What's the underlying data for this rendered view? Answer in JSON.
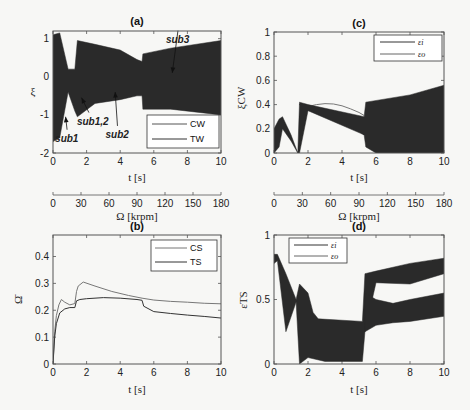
{
  "chart_data": [
    {
      "id": "a",
      "type": "line",
      "title": "(a)",
      "xlabel": "t [s]",
      "ylabel": "ξ",
      "xlim": [
        0,
        10
      ],
      "ylim": [
        -2,
        1.2
      ],
      "xticks": [
        0,
        2,
        4,
        6,
        8,
        10
      ],
      "yticks": [
        -2,
        -1,
        0,
        1
      ],
      "secondary_xaxis": {
        "label": "Ω [krpm]",
        "ticks": [
          0,
          30,
          60,
          90,
          120,
          150,
          180
        ]
      },
      "legend": {
        "position": "lower right",
        "entries": [
          "CW",
          "TW"
        ]
      },
      "annotations": [
        {
          "text": "sub1",
          "x": 0.6,
          "y": -1.6,
          "arrow_to": [
            0.75,
            -1.05
          ]
        },
        {
          "text": "sub1,2",
          "x": 1.9,
          "y": -1.15,
          "arrow_to": [
            1.7,
            -0.55
          ]
        },
        {
          "text": "sub2",
          "x": 3.6,
          "y": -1.5,
          "arrow_to": [
            3.7,
            -0.4
          ]
        },
        {
          "text": "sub3",
          "x": 7.2,
          "y": 1.0,
          "arrow_to": [
            7.1,
            0.1
          ]
        }
      ],
      "series": [
        {
          "name": "CW",
          "envelope_upper": [
            [
              0,
              1.1
            ],
            [
              0.4,
              1.15
            ],
            [
              0.9,
              0.2
            ],
            [
              1.3,
              0.2
            ],
            [
              1.45,
              0.95
            ],
            [
              2.5,
              0.85
            ],
            [
              4,
              0.7
            ],
            [
              5,
              0.45
            ],
            [
              5.3,
              0.4
            ],
            [
              5.35,
              0.6
            ],
            [
              7,
              0.75
            ],
            [
              10,
              0.95
            ]
          ],
          "envelope_lower": [
            [
              0,
              -1.7
            ],
            [
              0.4,
              -1.6
            ],
            [
              0.9,
              -0.4
            ],
            [
              1.3,
              -0.9
            ],
            [
              1.45,
              -1.05
            ],
            [
              2.5,
              -0.7
            ],
            [
              4,
              -0.6
            ],
            [
              5,
              -0.5
            ],
            [
              5.3,
              -0.5
            ],
            [
              5.35,
              -0.85
            ],
            [
              7,
              -0.85
            ],
            [
              10,
              -1.0
            ]
          ]
        },
        {
          "name": "TW"
        }
      ]
    },
    {
      "id": "b",
      "type": "line",
      "title": "(b)",
      "xlabel": "t [s]",
      "ylabel": "Ω̄",
      "xlim": [
        0,
        10
      ],
      "ylim": [
        0,
        0.48
      ],
      "xticks": [
        0,
        2,
        4,
        6,
        8,
        10
      ],
      "yticks": [
        0,
        0.1,
        0.2,
        0.3,
        0.4
      ],
      "legend": {
        "position": "upper right",
        "entries": [
          "CS",
          "TS"
        ]
      },
      "series": [
        {
          "name": "CS",
          "x": [
            0,
            0.1,
            0.2,
            0.35,
            0.5,
            0.7,
            1.0,
            1.3,
            1.4,
            1.5,
            1.8,
            2.5,
            3.5,
            4.5,
            5.3,
            6,
            7,
            8,
            9,
            10
          ],
          "y": [
            0,
            0.12,
            0.18,
            0.22,
            0.24,
            0.23,
            0.22,
            0.225,
            0.27,
            0.29,
            0.305,
            0.29,
            0.27,
            0.255,
            0.245,
            0.238,
            0.233,
            0.23,
            0.226,
            0.224
          ]
        },
        {
          "name": "TS",
          "x": [
            0,
            0.1,
            0.2,
            0.4,
            0.7,
            1.0,
            1.3,
            1.4,
            1.6,
            2.0,
            3.0,
            4.0,
            5.0,
            5.3,
            5.4,
            6,
            7,
            8,
            9,
            10
          ],
          "y": [
            0,
            0.1,
            0.15,
            0.19,
            0.205,
            0.21,
            0.21,
            0.235,
            0.24,
            0.243,
            0.247,
            0.245,
            0.24,
            0.237,
            0.215,
            0.195,
            0.188,
            0.182,
            0.177,
            0.171
          ]
        }
      ]
    },
    {
      "id": "c",
      "type": "line",
      "title": "(c)",
      "xlabel": "t [s]",
      "ylabel": "ξ_CW",
      "xlim": [
        0,
        10
      ],
      "ylim": [
        0,
        1
      ],
      "xticks": [
        0,
        2,
        4,
        6,
        8,
        10
      ],
      "yticks": [
        0,
        0.2,
        0.4,
        0.6,
        0.8,
        1
      ],
      "secondary_xaxis": {
        "label": "Ω [krpm]",
        "ticks": [
          0,
          30,
          60,
          90,
          120,
          150,
          180
        ]
      },
      "legend": {
        "position": "upper right",
        "entries": [
          "ε_i",
          "ε_o"
        ]
      },
      "series": [
        {
          "name": "ε_i",
          "x": [
            1.5,
            2,
            2.5,
            3,
            3.5,
            4,
            4.5,
            5,
            5.3
          ],
          "y": [
            0.4,
            0.385,
            0.4,
            0.408,
            0.405,
            0.39,
            0.365,
            0.335,
            0.31
          ]
        },
        {
          "name": "ε_o",
          "x": [
            1.5,
            2,
            2.5,
            3,
            3.5,
            4,
            4.5,
            5,
            5.3
          ],
          "y": [
            0.4,
            0.37,
            0.36,
            0.34,
            0.31,
            0.275,
            0.23,
            0.18,
            0.15
          ]
        },
        {
          "name": "dense_band",
          "envelope_upper": [
            [
              0,
              0.2
            ],
            [
              0.3,
              0.28
            ],
            [
              0.5,
              0.3
            ],
            [
              1.0,
              0.15
            ],
            [
              1.4,
              0.0
            ],
            [
              1.5,
              0.42
            ],
            [
              2,
              0.4
            ],
            [
              5.3,
              0.3
            ],
            [
              5.4,
              0.42
            ],
            [
              8,
              0.48
            ],
            [
              10,
              0.56
            ]
          ],
          "envelope_lower": [
            [
              0,
              0
            ],
            [
              0.3,
              0.05
            ],
            [
              0.5,
              0.2
            ],
            [
              1.0,
              0.1
            ],
            [
              1.4,
              0.0
            ],
            [
              1.5,
              0.0
            ],
            [
              2,
              0.35
            ],
            [
              5.3,
              0.15
            ],
            [
              5.4,
              0.05
            ],
            [
              6,
              0.0
            ],
            [
              10,
              0.0
            ]
          ]
        }
      ]
    },
    {
      "id": "d",
      "type": "line",
      "title": "(d)",
      "xlabel": "t [s]",
      "ylabel": "ε_TS",
      "xlim": [
        0,
        10
      ],
      "ylim": [
        0,
        1
      ],
      "xticks": [
        0,
        2,
        4,
        6,
        8,
        10
      ],
      "yticks": [
        0,
        0.5,
        1
      ],
      "legend": {
        "position": "upper left",
        "entries": [
          "ε_i",
          "ε_o"
        ]
      },
      "series": [
        {
          "name": "ε_i",
          "envelope_upper": [
            [
              0,
              0.85
            ],
            [
              0.2,
              0.85
            ],
            [
              0.7,
              0.7
            ],
            [
              1.3,
              0.5
            ],
            [
              1.5,
              0.62
            ],
            [
              2.0,
              0.55
            ],
            [
              2.3,
              0.4
            ],
            [
              2.6,
              0.35
            ],
            [
              5.2,
              0.33
            ],
            [
              5.35,
              0.7
            ],
            [
              6,
              0.72
            ],
            [
              8,
              0.78
            ],
            [
              10,
              0.82
            ]
          ],
          "envelope_lower": [
            [
              0,
              0.78
            ],
            [
              0.2,
              0.8
            ],
            [
              0.7,
              0.25
            ],
            [
              1.3,
              0.48
            ],
            [
              1.5,
              0.0
            ],
            [
              2.0,
              0.05
            ],
            [
              3,
              0.02
            ],
            [
              5.2,
              0.02
            ],
            [
              5.35,
              0.25
            ],
            [
              6,
              0.63
            ],
            [
              8,
              0.62
            ],
            [
              10,
              0.7
            ]
          ]
        },
        {
          "name": "ε_o",
          "envelope_upper": [
            [
              5.35,
              0.55
            ],
            [
              6,
              0.5
            ],
            [
              7,
              0.47
            ],
            [
              8,
              0.5
            ],
            [
              10,
              0.55
            ]
          ],
          "envelope_lower": [
            [
              5.35,
              0.25
            ],
            [
              6,
              0.3
            ],
            [
              7,
              0.32
            ],
            [
              8,
              0.33
            ],
            [
              10,
              0.37
            ]
          ]
        }
      ]
    }
  ],
  "panels": {
    "a": {
      "title": "(a)",
      "xlabel": "t [s]",
      "ylabel": "ξ",
      "omega_label": "Ω [krpm]",
      "legend": [
        "CW",
        "TW"
      ]
    },
    "b": {
      "title": "(b)",
      "xlabel": "t [s]",
      "ylabel": "Ω̄",
      "legend": [
        "CS",
        "TS"
      ]
    },
    "c": {
      "title": "(c)",
      "xlabel": "t [s]",
      "ylabel": "ξCW",
      "omega_label": "Ω [krpm]",
      "legend": [
        "εi",
        "εo"
      ]
    },
    "d": {
      "title": "(d)",
      "xlabel": "t [s]",
      "ylabel": "εTS",
      "legend": [
        "εi",
        "εo"
      ]
    }
  },
  "colors": {
    "band": "#2a2a2a",
    "line_dark": "#333333",
    "line_gray": "#777777",
    "axis": "#555555"
  }
}
